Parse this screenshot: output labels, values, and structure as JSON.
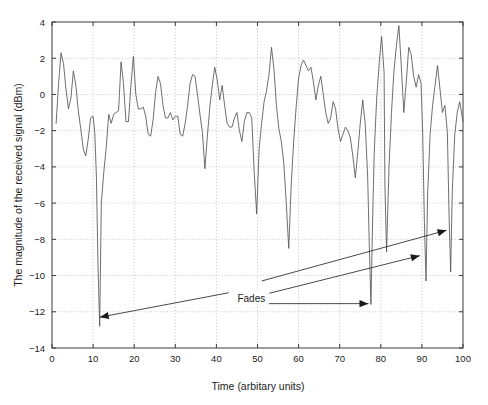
{
  "chart_data": {
    "type": "line",
    "title": "",
    "xlabel": "Time (arbitary units)",
    "ylabel": "The magnitude of the received signal (dBm)",
    "xlim": [
      0,
      100
    ],
    "ylim": [
      -14,
      4
    ],
    "xticks": [
      0,
      10,
      20,
      30,
      40,
      50,
      60,
      70,
      80,
      90,
      100
    ],
    "yticks": [
      4,
      2,
      0,
      -2,
      -4,
      -6,
      -8,
      -10,
      -12,
      -14
    ],
    "grid": true,
    "grid_style": "dotted",
    "legend": null,
    "line_color": "#555555",
    "series": [
      {
        "name": "received signal magnitude",
        "x": [
          1.0,
          1.6,
          2.2,
          2.8,
          3.4,
          4.0,
          4.6,
          5.2,
          5.8,
          6.4,
          7.0,
          7.6,
          8.2,
          8.8,
          9.4,
          10.0,
          10.4,
          10.8,
          11.2,
          11.6,
          12.0,
          12.6,
          13.2,
          13.8,
          14.4,
          15.0,
          15.6,
          16.2,
          16.8,
          17.4,
          18.0,
          18.6,
          19.2,
          19.8,
          20.4,
          21.0,
          21.6,
          22.2,
          22.8,
          23.4,
          24.0,
          24.6,
          25.2,
          25.8,
          26.4,
          27.0,
          27.6,
          28.2,
          28.8,
          29.4,
          30.0,
          30.6,
          31.2,
          31.8,
          32.4,
          33.0,
          33.6,
          34.2,
          34.8,
          35.4,
          36.0,
          36.6,
          37.2,
          37.8,
          38.4,
          39.0,
          39.6,
          40.2,
          40.8,
          41.4,
          42.0,
          42.6,
          43.2,
          43.8,
          44.4,
          45.0,
          45.6,
          46.2,
          46.8,
          47.4,
          48.0,
          48.6,
          49.2,
          49.8,
          50.4,
          51.0,
          51.6,
          52.2,
          52.8,
          53.4,
          54.0,
          54.6,
          55.2,
          55.8,
          56.4,
          57.0,
          57.6,
          58.2,
          58.8,
          59.4,
          60.0,
          60.6,
          61.2,
          61.8,
          62.4,
          63.0,
          63.6,
          64.2,
          64.8,
          65.4,
          66.0,
          66.6,
          67.2,
          67.8,
          68.4,
          69.0,
          69.6,
          70.2,
          70.8,
          71.4,
          72.0,
          72.6,
          73.2,
          73.8,
          74.4,
          75.0,
          75.6,
          76.2,
          76.8,
          77.2,
          77.6,
          78.0,
          78.4,
          79.0,
          79.6,
          80.2,
          80.8,
          81.0,
          81.4,
          82.0,
          82.6,
          83.2,
          83.8,
          84.4,
          85.0,
          85.6,
          86.2,
          86.8,
          87.4,
          88.0,
          88.6,
          89.2,
          89.8,
          90.2,
          90.6,
          91.0,
          91.4,
          92.0,
          92.6,
          93.2,
          93.8,
          94.4,
          95.0,
          95.6,
          96.2,
          96.6,
          97.0,
          97.4,
          98.0,
          98.6,
          99.2,
          100.0
        ],
        "y": [
          -1.6,
          0.6,
          2.3,
          1.7,
          0.3,
          -0.8,
          -0.2,
          1.3,
          0.5,
          -0.9,
          -1.9,
          -3.0,
          -3.4,
          -2.5,
          -1.3,
          -1.2,
          -2.1,
          -4.5,
          -9.5,
          -12.8,
          -6.0,
          -4.3,
          -2.9,
          -1.1,
          -1.6,
          -1.1,
          -1.0,
          -0.9,
          1.8,
          0.6,
          -1.5,
          -1.5,
          0.5,
          2.1,
          0.0,
          -0.8,
          -0.8,
          -0.7,
          -1.2,
          -2.2,
          -2.3,
          -1.4,
          0.1,
          1.0,
          0.6,
          -0.6,
          -1.3,
          -1.3,
          -1.0,
          -1.4,
          -1.2,
          -1.2,
          -2.2,
          -2.3,
          -1.6,
          -0.6,
          0.6,
          1.1,
          1.0,
          0.0,
          -1.1,
          -2.1,
          -4.1,
          -2.3,
          -0.7,
          0.5,
          1.5,
          0.8,
          -0.3,
          0.5,
          -0.6,
          -1.6,
          -1.8,
          -1.8,
          -1.3,
          -1.0,
          -2.0,
          -2.6,
          -1.5,
          -1.0,
          -1.0,
          -1.3,
          -4.3,
          -6.6,
          -3.0,
          -1.6,
          -0.4,
          0.2,
          1.1,
          2.6,
          1.4,
          -0.6,
          -1.9,
          -2.6,
          -3.8,
          -6.0,
          -8.5,
          -5.0,
          -2.6,
          -0.7,
          0.9,
          1.6,
          1.9,
          1.6,
          1.3,
          1.5,
          0.7,
          -0.3,
          0.5,
          1.0,
          0.0,
          -1.0,
          -1.6,
          -1.3,
          -0.4,
          -0.8,
          -1.9,
          -2.6,
          -2.2,
          -1.8,
          -2.0,
          -2.4,
          -3.4,
          -4.6,
          -3.2,
          -1.6,
          -0.3,
          -1.6,
          -4.5,
          -8.3,
          -11.6,
          -7.0,
          -3.2,
          -0.2,
          1.7,
          3.2,
          1.2,
          -5.0,
          -8.7,
          -4.0,
          -1.0,
          1.3,
          2.7,
          3.8,
          1.5,
          -1.0,
          0.7,
          2.6,
          2.2,
          1.0,
          0.4,
          1.1,
          0.6,
          -2.2,
          -7.0,
          -10.3,
          -5.5,
          -2.2,
          -0.6,
          0.5,
          1.6,
          0.3,
          -1.0,
          -0.6,
          -2.1,
          -6.6,
          -9.8,
          -5.3,
          -2.2,
          -1.0,
          -0.4,
          -1.5
        ]
      }
    ],
    "annotations": [
      {
        "label": "Fades",
        "label_x": 48.5,
        "label_y": -11.25,
        "arrows": [
          {
            "name": "fade-arrow-left",
            "from_x": 43.0,
            "from_y": -10.95,
            "to_x": 11.6,
            "to_y": -12.3,
            "style": "solid"
          },
          {
            "name": "fade-arrow-mid",
            "from_x": 52.5,
            "from_y": -11.55,
            "to_x": 77.0,
            "to_y": -11.55,
            "style": "solid"
          },
          {
            "name": "fade-arrow-upper",
            "from_x": 52.5,
            "from_y": -11.0,
            "to_x": 89.5,
            "to_y": -8.9,
            "style": "solid"
          },
          {
            "name": "fade-arrow-top",
            "from_x": 51.0,
            "from_y": -10.3,
            "to_x": 96.0,
            "to_y": -7.5,
            "style": "solid"
          }
        ]
      }
    ]
  },
  "axes": {
    "x_tick_labels": [
      "0",
      "10",
      "20",
      "30",
      "40",
      "50",
      "60",
      "70",
      "80",
      "90",
      "100"
    ],
    "y_tick_labels": [
      "4",
      "2",
      "0",
      "−2",
      "−4",
      "−6",
      "−8",
      "−10",
      "−12",
      "−14"
    ],
    "x_axis_title": "Time (arbitary units)",
    "y_axis_title": "The magnitude of the received signal (dBm)"
  },
  "style": {
    "background": "#ffffff",
    "axis_color": "#3a3a3a",
    "grid_color": "#b4b4b4",
    "trace_color": "#5a5a5a",
    "annotation_color": "#1a1a1a"
  }
}
